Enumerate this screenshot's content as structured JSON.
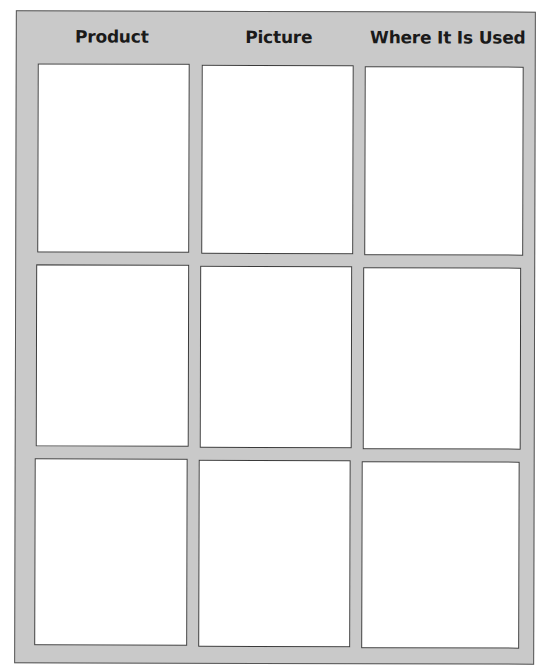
{
  "worksheet": {
    "header": {
      "columns": [
        {
          "label": "Product"
        },
        {
          "label": "Picture"
        },
        {
          "label": "Where It Is Used"
        }
      ]
    },
    "rows": [
      {
        "product": "",
        "picture": "",
        "where_used": ""
      },
      {
        "product": "",
        "picture": "",
        "where_used": ""
      },
      {
        "product": "",
        "picture": "",
        "where_used": ""
      }
    ],
    "colors": {
      "frame": "#c9c9c9",
      "cell": "#ffffff",
      "border": "#3a3a3a",
      "header_text": "#1a1a1a"
    }
  }
}
